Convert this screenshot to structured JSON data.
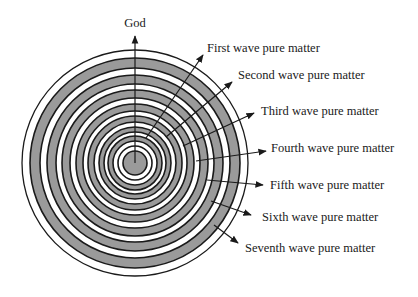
{
  "diagram": {
    "type": "concentric-rings",
    "center": {
      "x": 135,
      "y": 163
    },
    "colors": {
      "ring_fill": "#9a9a9a",
      "background": "#ffffff",
      "stroke": "#1a1a1a",
      "text": "#1a1a1a"
    },
    "top_arrow": {
      "label": "God",
      "label_pos": {
        "x": 135,
        "y": 27
      },
      "from": {
        "x": 135,
        "y": 163
      },
      "to": {
        "x": 135,
        "y": 36
      }
    },
    "bands": [
      {
        "r_outer": 113,
        "fill": "white"
      },
      {
        "r_outer": 105,
        "fill": "gray"
      },
      {
        "r_outer": 95,
        "fill": "white"
      },
      {
        "r_outer": 88,
        "fill": "gray"
      },
      {
        "r_outer": 79,
        "fill": "white"
      },
      {
        "r_outer": 73,
        "fill": "gray"
      },
      {
        "r_outer": 65,
        "fill": "white"
      },
      {
        "r_outer": 59,
        "fill": "gray"
      },
      {
        "r_outer": 52,
        "fill": "white"
      },
      {
        "r_outer": 47,
        "fill": "gray"
      },
      {
        "r_outer": 41,
        "fill": "white"
      },
      {
        "r_outer": 36,
        "fill": "gray"
      },
      {
        "r_outer": 31,
        "fill": "white"
      },
      {
        "r_outer": 27,
        "fill": "gray"
      },
      {
        "r_outer": 22,
        "fill": "white"
      },
      {
        "r_outer": 17,
        "fill": "white"
      },
      {
        "r_outer": 12,
        "fill": "gray"
      }
    ],
    "labels": [
      {
        "text": "First wave pure matter",
        "x": 207,
        "y": 52,
        "from": {
          "x": 146,
          "y": 138
        },
        "to": {
          "x": 203,
          "y": 55
        }
      },
      {
        "text": "Second wave pure matter",
        "x": 238,
        "y": 79,
        "from": {
          "x": 166,
          "y": 137
        },
        "to": {
          "x": 232,
          "y": 82
        }
      },
      {
        "text": "Third wave pure matter",
        "x": 261,
        "y": 115,
        "from": {
          "x": 183,
          "y": 146
        },
        "to": {
          "x": 254,
          "y": 113
        }
      },
      {
        "text": "Fourth wave pure matter",
        "x": 271,
        "y": 152,
        "from": {
          "x": 196,
          "y": 161
        },
        "to": {
          "x": 266,
          "y": 151
        }
      },
      {
        "text": "Fifth wave pure matter",
        "x": 270,
        "y": 189,
        "from": {
          "x": 207,
          "y": 180
        },
        "to": {
          "x": 263,
          "y": 185
        }
      },
      {
        "text": "Sixth wave pure matter",
        "x": 262,
        "y": 221,
        "from": {
          "x": 211,
          "y": 201
        },
        "to": {
          "x": 251,
          "y": 215
        }
      },
      {
        "text": "Seventh wave pure matter",
        "x": 245,
        "y": 252,
        "from": {
          "x": 214,
          "y": 225
        },
        "to": {
          "x": 238,
          "y": 243
        }
      }
    ]
  }
}
